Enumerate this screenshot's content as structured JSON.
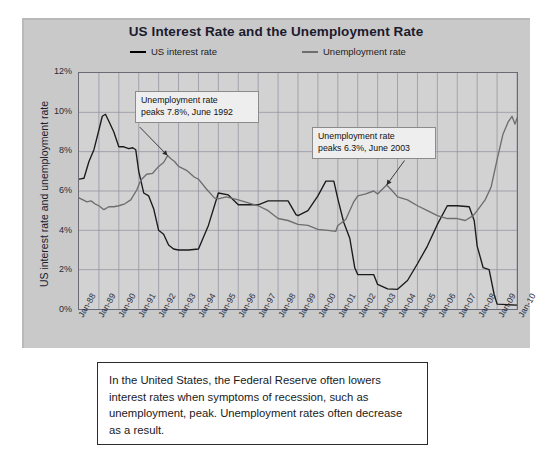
{
  "chart_data": {
    "type": "line",
    "title": "US Interest Rate and the Unemployment Rate",
    "xlabel": "",
    "ylabel": "US interest rate and unemployment rate",
    "ylim": [
      0,
      12
    ],
    "ytick_labels": [
      "0%",
      "2%",
      "4%",
      "6%",
      "8%",
      "10%",
      "12%"
    ],
    "ytick_values": [
      0,
      2,
      4,
      6,
      8,
      10,
      12
    ],
    "grid": true,
    "legend_position": "top",
    "x_start_year": 1988,
    "x_end_year": 2010,
    "categories": [
      "Jan-88",
      "Jan-89",
      "Jan-90",
      "Jan-91",
      "Jan-92",
      "Jan-93",
      "Jan-94",
      "Jan-95",
      "Jan-96",
      "Jan-97",
      "Jan-98",
      "Jan-99",
      "Jan-00",
      "Jan-01",
      "Jan-02",
      "Jan-03",
      "Jan-04",
      "Jan-05",
      "Jan-06",
      "Jan-07",
      "Jan-08",
      "Jan-09",
      "Jan-10"
    ],
    "series": [
      {
        "name": "US interest rate",
        "color": "#1a1a1a",
        "points": [
          [
            1988.0,
            6.6
          ],
          [
            1988.25,
            6.65
          ],
          [
            1988.5,
            7.5
          ],
          [
            1988.75,
            8.1
          ],
          [
            1989.0,
            9.1
          ],
          [
            1989.17,
            9.8
          ],
          [
            1989.33,
            9.9
          ],
          [
            1989.5,
            9.55
          ],
          [
            1989.75,
            9.0
          ],
          [
            1990.0,
            8.25
          ],
          [
            1990.25,
            8.25
          ],
          [
            1990.5,
            8.15
          ],
          [
            1990.7,
            8.2
          ],
          [
            1990.85,
            8.1
          ],
          [
            1991.0,
            7.0
          ],
          [
            1991.25,
            5.9
          ],
          [
            1991.5,
            5.75
          ],
          [
            1991.75,
            5.1
          ],
          [
            1992.0,
            4.0
          ],
          [
            1992.25,
            3.8
          ],
          [
            1992.5,
            3.25
          ],
          [
            1992.75,
            3.05
          ],
          [
            1993.0,
            3.0
          ],
          [
            1993.5,
            3.0
          ],
          [
            1994.0,
            3.05
          ],
          [
            1994.5,
            4.25
          ],
          [
            1995.0,
            5.9
          ],
          [
            1995.5,
            5.8
          ],
          [
            1996.0,
            5.3
          ],
          [
            1996.5,
            5.3
          ],
          [
            1997.0,
            5.3
          ],
          [
            1997.5,
            5.5
          ],
          [
            1998.0,
            5.5
          ],
          [
            1998.5,
            5.5
          ],
          [
            1998.9,
            4.8
          ],
          [
            1999.0,
            4.75
          ],
          [
            1999.5,
            5.0
          ],
          [
            2000.0,
            5.75
          ],
          [
            2000.4,
            6.5
          ],
          [
            2000.8,
            6.5
          ],
          [
            2001.0,
            5.6
          ],
          [
            2001.3,
            4.4
          ],
          [
            2001.6,
            3.6
          ],
          [
            2001.85,
            2.1
          ],
          [
            2002.0,
            1.75
          ],
          [
            2002.8,
            1.75
          ],
          [
            2003.0,
            1.25
          ],
          [
            2003.5,
            1.02
          ],
          [
            2004.0,
            1.0
          ],
          [
            2004.5,
            1.45
          ],
          [
            2005.0,
            2.3
          ],
          [
            2005.5,
            3.2
          ],
          [
            2006.0,
            4.3
          ],
          [
            2006.5,
            5.25
          ],
          [
            2007.0,
            5.25
          ],
          [
            2007.6,
            5.2
          ],
          [
            2007.85,
            4.5
          ],
          [
            2008.0,
            3.2
          ],
          [
            2008.3,
            2.1
          ],
          [
            2008.6,
            2.0
          ],
          [
            2008.85,
            0.75
          ],
          [
            2009.0,
            0.25
          ],
          [
            2009.5,
            0.22
          ],
          [
            2010.0,
            0.2
          ]
        ]
      },
      {
        "name": "Unemployment rate",
        "color": "#6e6e6e",
        "points": [
          [
            1988.0,
            5.65
          ],
          [
            1988.2,
            5.55
          ],
          [
            1988.4,
            5.45
          ],
          [
            1988.6,
            5.5
          ],
          [
            1988.8,
            5.35
          ],
          [
            1989.0,
            5.25
          ],
          [
            1989.25,
            5.05
          ],
          [
            1989.5,
            5.2
          ],
          [
            1989.75,
            5.2
          ],
          [
            1990.0,
            5.25
          ],
          [
            1990.3,
            5.35
          ],
          [
            1990.6,
            5.55
          ],
          [
            1990.9,
            6.05
          ],
          [
            1991.1,
            6.55
          ],
          [
            1991.4,
            6.85
          ],
          [
            1991.7,
            6.9
          ],
          [
            1992.0,
            7.25
          ],
          [
            1992.25,
            7.45
          ],
          [
            1992.45,
            7.8
          ],
          [
            1992.6,
            7.65
          ],
          [
            1992.8,
            7.5
          ],
          [
            1993.0,
            7.25
          ],
          [
            1993.4,
            7.05
          ],
          [
            1993.8,
            6.7
          ],
          [
            1994.0,
            6.6
          ],
          [
            1994.4,
            6.1
          ],
          [
            1994.8,
            5.65
          ],
          [
            1995.0,
            5.6
          ],
          [
            1995.4,
            5.7
          ],
          [
            1995.8,
            5.6
          ],
          [
            1996.0,
            5.55
          ],
          [
            1996.5,
            5.4
          ],
          [
            1997.0,
            5.25
          ],
          [
            1997.5,
            5.0
          ],
          [
            1998.0,
            4.6
          ],
          [
            1998.5,
            4.5
          ],
          [
            1999.0,
            4.3
          ],
          [
            1999.5,
            4.25
          ],
          [
            2000.0,
            4.05
          ],
          [
            2000.5,
            4.0
          ],
          [
            2000.9,
            3.95
          ],
          [
            2001.0,
            4.25
          ],
          [
            2001.4,
            4.55
          ],
          [
            2001.8,
            5.45
          ],
          [
            2002.0,
            5.75
          ],
          [
            2002.4,
            5.85
          ],
          [
            2002.8,
            6.0
          ],
          [
            2003.0,
            5.85
          ],
          [
            2003.45,
            6.3
          ],
          [
            2003.7,
            6.05
          ],
          [
            2004.0,
            5.7
          ],
          [
            2004.5,
            5.55
          ],
          [
            2005.0,
            5.25
          ],
          [
            2005.5,
            5.0
          ],
          [
            2006.0,
            4.75
          ],
          [
            2006.5,
            4.6
          ],
          [
            2007.0,
            4.6
          ],
          [
            2007.4,
            4.5
          ],
          [
            2007.8,
            4.75
          ],
          [
            2008.0,
            5.0
          ],
          [
            2008.4,
            5.55
          ],
          [
            2008.7,
            6.2
          ],
          [
            2009.0,
            7.6
          ],
          [
            2009.3,
            8.9
          ],
          [
            2009.55,
            9.5
          ],
          [
            2009.75,
            9.8
          ],
          [
            2009.9,
            9.4
          ],
          [
            2010.0,
            9.7
          ]
        ]
      }
    ],
    "annotations": [
      {
        "id": "callout-1",
        "line1": "Unemployment rate",
        "line2": "peaks 7.8%, June 1992",
        "target_x": 1992.45,
        "target_y": 7.8
      },
      {
        "id": "callout-2",
        "line1": "Unemployment rate",
        "line2": "peaks 6.3%, June 2003",
        "target_x": 2003.45,
        "target_y": 6.3
      }
    ]
  },
  "legend": {
    "items": [
      {
        "label": "US interest rate"
      },
      {
        "label": "Unemployment rate"
      }
    ]
  },
  "caption": {
    "text": "In the United States, the Federal Reserve often lowers interest rates when symptoms of recession, such as unemployment, peak. Unemployment rates often decrease as a result."
  }
}
